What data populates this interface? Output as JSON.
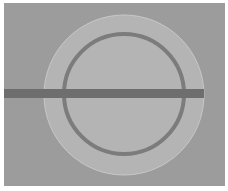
{
  "diagram": {
    "type": "ring-resonator-schematic",
    "canvas": {
      "width": 228,
      "height": 191
    },
    "colors": {
      "page": "#ffffff",
      "background": "#9c9c9c",
      "cladding_disc": "#b4b4b4",
      "cladding_edge": "#c8c8c8",
      "ring": "#7c7c7c",
      "waveguide": "#6e6e6e"
    },
    "elements": {
      "background_rect": {
        "x": 4,
        "y": 3,
        "w": 221,
        "h": 183
      },
      "cladding_disc": {
        "cx": 124,
        "cy": 95,
        "r": 80
      },
      "ring": {
        "cx": 124,
        "cy": 94,
        "r": 60,
        "stroke": 4
      },
      "bus_waveguide": {
        "x": 4,
        "y": 89,
        "w": 200,
        "h": 9
      }
    }
  }
}
